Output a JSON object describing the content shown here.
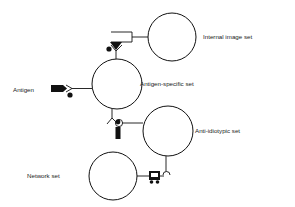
{
  "diagram": {
    "title": "",
    "nodes": [
      {
        "id": "internal",
        "label": "Internal image set",
        "cx": 172,
        "cy": 37,
        "r": 24,
        "label_x": 203,
        "label_y": 39
      },
      {
        "id": "antigen_specific",
        "label": "Antigen-specific set",
        "cx": 117,
        "cy": 84,
        "r": 25,
        "label_x": 140,
        "label_y": 86
      },
      {
        "id": "anti_idiotypic",
        "label": "Anti-idiotypic set",
        "cx": 168,
        "cy": 131,
        "r": 25,
        "label_x": 195,
        "label_y": 133
      },
      {
        "id": "network",
        "label": "Network set",
        "cx": 113,
        "cy": 176,
        "r": 24,
        "label_x": 27,
        "label_y": 178
      }
    ],
    "antigen_label": "Antigen",
    "colors": {
      "stroke": "#111111",
      "fill": "#111111",
      "text": "#222222",
      "background": "#ffffff"
    }
  }
}
